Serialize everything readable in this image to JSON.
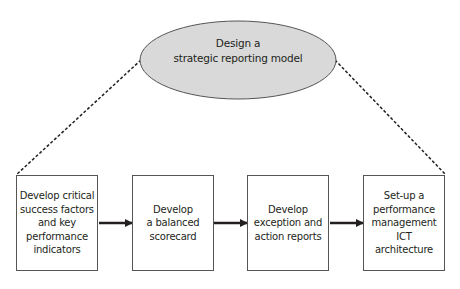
{
  "diagram": {
    "top_node": {
      "line1": "Design a",
      "line2": "strategic reporting model",
      "fill": "#d9d9d9"
    },
    "steps": [
      {
        "lines": [
          "Develop critical",
          "success factors",
          "and key",
          "performance",
          "indicators"
        ]
      },
      {
        "lines": [
          "Develop",
          "a balanced",
          "scorecard"
        ]
      },
      {
        "lines": [
          "Develop",
          "exception and",
          "action reports"
        ]
      },
      {
        "lines": [
          "Set-up a",
          "performance",
          "management",
          "ICT architecture"
        ]
      }
    ],
    "connector_style": "dashed",
    "arrow_color": "#231f20"
  }
}
